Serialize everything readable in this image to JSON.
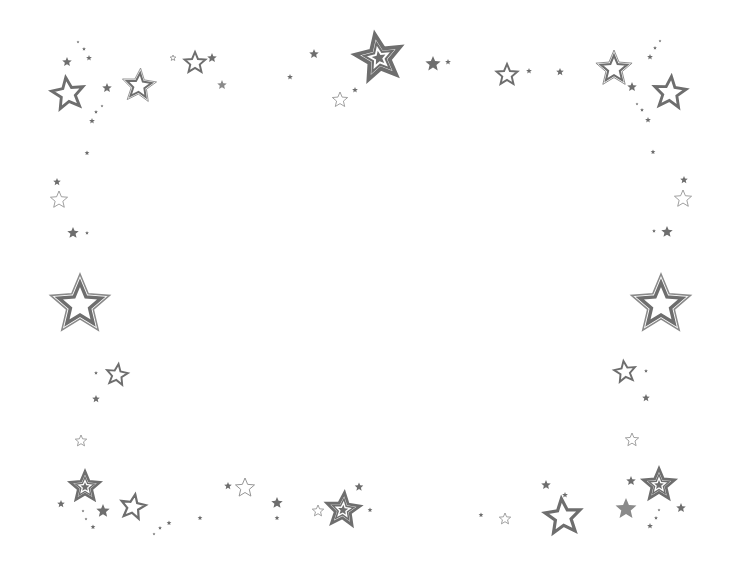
{
  "image": {
    "width": 735,
    "height": 571,
    "background": "#ffffff",
    "star_color": "#6e6e6e",
    "star_light_color": "#8a8a8a"
  },
  "stars": [
    {
      "x": 68,
      "y": 94,
      "r": 18,
      "style": "outline",
      "rot": -8
    },
    {
      "x": 139,
      "y": 86,
      "r": 18,
      "style": "double",
      "rot": 5
    },
    {
      "x": 195,
      "y": 63,
      "r": 12,
      "style": "outline",
      "rot": 0
    },
    {
      "x": 212,
      "y": 58,
      "r": 5,
      "style": "solid",
      "rot": 0
    },
    {
      "x": 222,
      "y": 85,
      "r": 5,
      "style": "solid-light",
      "rot": 0
    },
    {
      "x": 173,
      "y": 58,
      "r": 3,
      "style": "outline-thin",
      "rot": 0
    },
    {
      "x": 67,
      "y": 62,
      "r": 5,
      "style": "solid",
      "rot": 0
    },
    {
      "x": 89,
      "y": 58,
      "r": 3,
      "style": "solid",
      "rot": 0
    },
    {
      "x": 84,
      "y": 49,
      "r": 2,
      "style": "solid",
      "rot": 0
    },
    {
      "x": 78,
      "y": 42,
      "r": 1.5,
      "style": "solid",
      "rot": 0
    },
    {
      "x": 107,
      "y": 88,
      "r": 5,
      "style": "solid",
      "rot": 0
    },
    {
      "x": 96,
      "y": 112,
      "r": 2,
      "style": "solid",
      "rot": 0
    },
    {
      "x": 102,
      "y": 106,
      "r": 1.5,
      "style": "solid",
      "rot": 0
    },
    {
      "x": 92,
      "y": 121,
      "r": 3,
      "style": "solid",
      "rot": 0
    },
    {
      "x": 379,
      "y": 58,
      "r": 26,
      "style": "triple",
      "rot": -10
    },
    {
      "x": 314,
      "y": 54,
      "r": 5,
      "style": "solid",
      "rot": 0
    },
    {
      "x": 290,
      "y": 77,
      "r": 3,
      "style": "solid",
      "rot": 0
    },
    {
      "x": 355,
      "y": 90,
      "r": 3,
      "style": "solid",
      "rot": 0
    },
    {
      "x": 340,
      "y": 100,
      "r": 8,
      "style": "outline-thin",
      "rot": 0
    },
    {
      "x": 433,
      "y": 64,
      "r": 8,
      "style": "solid",
      "rot": 0
    },
    {
      "x": 448,
      "y": 62,
      "r": 3,
      "style": "solid",
      "rot": 0
    },
    {
      "x": 507,
      "y": 75,
      "r": 12,
      "style": "outline",
      "rot": 0
    },
    {
      "x": 529,
      "y": 71,
      "r": 3,
      "style": "solid",
      "rot": 0
    },
    {
      "x": 560,
      "y": 72,
      "r": 4,
      "style": "solid",
      "rot": 0
    },
    {
      "x": 614,
      "y": 69,
      "r": 19,
      "style": "double",
      "rot": 0
    },
    {
      "x": 632,
      "y": 87,
      "r": 5,
      "style": "solid",
      "rot": 0
    },
    {
      "x": 670,
      "y": 93,
      "r": 18,
      "style": "outline",
      "rot": 5
    },
    {
      "x": 650,
      "y": 57,
      "r": 3,
      "style": "solid",
      "rot": 0
    },
    {
      "x": 655,
      "y": 48,
      "r": 2,
      "style": "solid",
      "rot": 0
    },
    {
      "x": 660,
      "y": 41,
      "r": 1.5,
      "style": "solid",
      "rot": 0
    },
    {
      "x": 637,
      "y": 104,
      "r": 1.5,
      "style": "solid",
      "rot": 0
    },
    {
      "x": 642,
      "y": 110,
      "r": 2,
      "style": "solid",
      "rot": 0
    },
    {
      "x": 648,
      "y": 120,
      "r": 3,
      "style": "solid",
      "rot": 0
    },
    {
      "x": 87,
      "y": 153,
      "r": 2.5,
      "style": "solid",
      "rot": 0
    },
    {
      "x": 57,
      "y": 182,
      "r": 4,
      "style": "solid",
      "rot": 0
    },
    {
      "x": 59,
      "y": 200,
      "r": 9,
      "style": "outline-thin",
      "rot": 0
    },
    {
      "x": 73,
      "y": 233,
      "r": 6,
      "style": "solid",
      "rot": 0
    },
    {
      "x": 87,
      "y": 233,
      "r": 2,
      "style": "solid",
      "rot": 0
    },
    {
      "x": 80,
      "y": 305,
      "r": 31,
      "style": "double",
      "rot": 0
    },
    {
      "x": 117,
      "y": 375,
      "r": 12,
      "style": "outline",
      "rot": 8
    },
    {
      "x": 96,
      "y": 373,
      "r": 2,
      "style": "solid",
      "rot": 0
    },
    {
      "x": 96,
      "y": 399,
      "r": 4,
      "style": "solid",
      "rot": 0
    },
    {
      "x": 653,
      "y": 152,
      "r": 2.5,
      "style": "solid",
      "rot": 0
    },
    {
      "x": 684,
      "y": 180,
      "r": 4,
      "style": "solid",
      "rot": 0
    },
    {
      "x": 683,
      "y": 199,
      "r": 9,
      "style": "outline-thin",
      "rot": 0
    },
    {
      "x": 667,
      "y": 232,
      "r": 6,
      "style": "solid",
      "rot": 0
    },
    {
      "x": 654,
      "y": 231,
      "r": 2,
      "style": "solid",
      "rot": 0
    },
    {
      "x": 661,
      "y": 305,
      "r": 31,
      "style": "double",
      "rot": 0
    },
    {
      "x": 625,
      "y": 372,
      "r": 12,
      "style": "outline",
      "rot": -8
    },
    {
      "x": 646,
      "y": 371,
      "r": 2,
      "style": "solid",
      "rot": 0
    },
    {
      "x": 646,
      "y": 398,
      "r": 4,
      "style": "solid",
      "rot": 0
    },
    {
      "x": 81,
      "y": 441,
      "r": 6,
      "style": "outline-thin",
      "rot": 0
    },
    {
      "x": 85,
      "y": 487,
      "r": 17,
      "style": "triple",
      "rot": 0
    },
    {
      "x": 61,
      "y": 504,
      "r": 4,
      "style": "solid",
      "rot": 0
    },
    {
      "x": 103,
      "y": 511,
      "r": 7,
      "style": "solid",
      "rot": 0
    },
    {
      "x": 133,
      "y": 507,
      "r": 14,
      "style": "outline",
      "rot": 10
    },
    {
      "x": 83,
      "y": 511,
      "r": 1.5,
      "style": "solid",
      "rot": 0
    },
    {
      "x": 86,
      "y": 519,
      "r": 1.5,
      "style": "solid",
      "rot": 0
    },
    {
      "x": 93,
      "y": 527,
      "r": 2.5,
      "style": "solid",
      "rot": 0
    },
    {
      "x": 154,
      "y": 534,
      "r": 1.5,
      "style": "solid",
      "rot": 0
    },
    {
      "x": 160,
      "y": 528,
      "r": 2,
      "style": "solid",
      "rot": 0
    },
    {
      "x": 169,
      "y": 523,
      "r": 2.5,
      "style": "solid",
      "rot": 0
    },
    {
      "x": 200,
      "y": 518,
      "r": 2.5,
      "style": "solid",
      "rot": 0
    },
    {
      "x": 228,
      "y": 486,
      "r": 4,
      "style": "solid",
      "rot": 0
    },
    {
      "x": 245,
      "y": 488,
      "r": 10,
      "style": "outline-thin",
      "rot": 0
    },
    {
      "x": 277,
      "y": 503,
      "r": 6,
      "style": "solid",
      "rot": 0
    },
    {
      "x": 277,
      "y": 518,
      "r": 2.5,
      "style": "solid",
      "rot": 0
    },
    {
      "x": 318,
      "y": 511,
      "r": 6,
      "style": "outline-thin",
      "rot": 0
    },
    {
      "x": 343,
      "y": 510,
      "r": 19,
      "style": "triple",
      "rot": 5
    },
    {
      "x": 359,
      "y": 487,
      "r": 4.5,
      "style": "solid",
      "rot": 0
    },
    {
      "x": 370,
      "y": 510,
      "r": 2.5,
      "style": "solid",
      "rot": 0
    },
    {
      "x": 481,
      "y": 515,
      "r": 2.5,
      "style": "solid",
      "rot": 0
    },
    {
      "x": 505,
      "y": 519,
      "r": 6,
      "style": "outline-thin",
      "rot": 0
    },
    {
      "x": 546,
      "y": 485,
      "r": 5,
      "style": "solid",
      "rot": 0
    },
    {
      "x": 565,
      "y": 495,
      "r": 3,
      "style": "solid",
      "rot": 0
    },
    {
      "x": 563,
      "y": 517,
      "r": 20,
      "style": "outline",
      "rot": -5
    },
    {
      "x": 632,
      "y": 440,
      "r": 7,
      "style": "outline-thin",
      "rot": 0
    },
    {
      "x": 631,
      "y": 481,
      "r": 5,
      "style": "solid",
      "rot": 0
    },
    {
      "x": 659,
      "y": 485,
      "r": 18,
      "style": "triple",
      "rot": 0
    },
    {
      "x": 626,
      "y": 509,
      "r": 11,
      "style": "solid-light",
      "rot": 0
    },
    {
      "x": 681,
      "y": 508,
      "r": 5,
      "style": "solid",
      "rot": 0
    },
    {
      "x": 659,
      "y": 510,
      "r": 1.5,
      "style": "solid",
      "rot": 0
    },
    {
      "x": 656,
      "y": 518,
      "r": 2,
      "style": "solid",
      "rot": 0
    },
    {
      "x": 650,
      "y": 526,
      "r": 3,
      "style": "solid",
      "rot": 0
    }
  ]
}
